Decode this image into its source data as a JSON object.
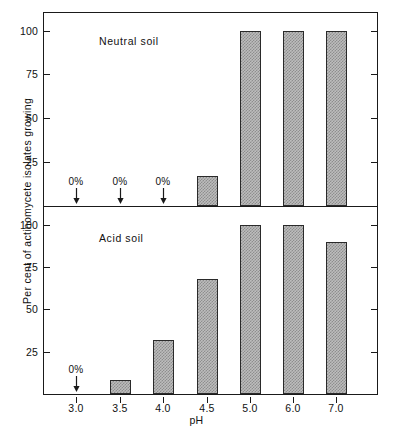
{
  "chart_data": {
    "type": "bar",
    "title": "",
    "xlabel": "pH",
    "ylabel": "Per cent of actinomycete isolates growing",
    "categories": [
      "3.0",
      "3.5",
      "4.0",
      "4.5",
      "5.0",
      "6.0",
      "7.0"
    ],
    "ylim": [
      0,
      110
    ],
    "yticks": [
      25,
      50,
      75,
      100
    ],
    "ytick_labels": [
      "25",
      "50",
      "75",
      "100"
    ],
    "grid": false,
    "legend": "none",
    "panels": [
      {
        "name": "neutral-soil-panel",
        "label": "Neutral soil",
        "values": [
          0,
          0,
          0,
          17,
          100,
          100,
          100
        ],
        "zero_annotations": [
          {
            "category": "3.0",
            "text": "0%"
          },
          {
            "category": "3.5",
            "text": "0%"
          },
          {
            "category": "4.0",
            "text": "0%"
          }
        ]
      },
      {
        "name": "acid-soil-panel",
        "label": "Acid soil",
        "values": [
          0,
          8,
          32,
          68,
          100,
          100,
          90
        ],
        "zero_annotations": [
          {
            "category": "3.0",
            "text": "0%"
          }
        ]
      }
    ],
    "colors": {
      "bar_fill": "#bdbdbd",
      "bar_hatch": "#8e8e8e",
      "bar_edge": "#2a2a2a",
      "axis": "#1a1a1a",
      "background": "#ffffff"
    }
  },
  "axis": {
    "y_title": "Per cent of actinomycete isolates growing",
    "x_title": "pH",
    "x_labels": [
      "3.0",
      "3.5",
      "4.0",
      "4.5",
      "5.0",
      "6.0",
      "7.0"
    ],
    "y_labels_top": [
      "100",
      "75",
      "50",
      "25"
    ],
    "y_labels_bottom": [
      "100",
      "75",
      "50",
      "25"
    ]
  },
  "annotations": {
    "neutral_caption": "Neutral soil",
    "acid_caption": "Acid soil",
    "zero_label": "0%"
  }
}
